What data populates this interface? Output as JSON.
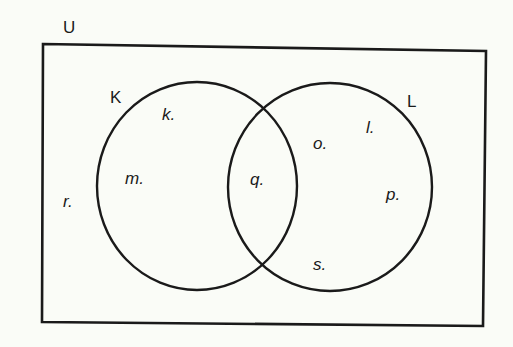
{
  "diagram": {
    "type": "venn",
    "universe": {
      "label": "U",
      "elements": [
        "r."
      ]
    },
    "sets": [
      {
        "label": "K",
        "only_elements": [
          "k.",
          "m."
        ]
      },
      {
        "label": "L",
        "only_elements": [
          "o.",
          "l.",
          "p.",
          "s."
        ]
      }
    ],
    "intersection": {
      "sets": [
        "K",
        "L"
      ],
      "elements": [
        "q."
      ]
    },
    "colors": {
      "stroke": "#1a1a1a",
      "background": "#fafcf7"
    }
  },
  "labels": {
    "U": "U",
    "K": "K",
    "L": "L",
    "k": "k.",
    "m": "m.",
    "q": "q.",
    "o": "o.",
    "l": "l.",
    "p": "p.",
    "s": "s.",
    "r": "r."
  }
}
